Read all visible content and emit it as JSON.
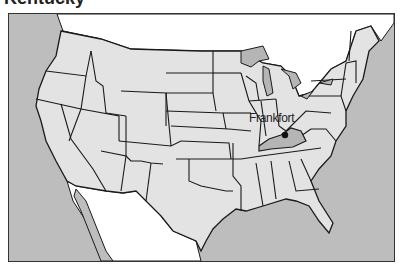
{
  "title": "Kentucky",
  "map": {
    "highlighted_state": "Kentucky",
    "capital_label": "Frankfort",
    "colors": {
      "ocean": "#bdbdbd",
      "states": "#e3e3e3",
      "highlight": "#b5b5b5",
      "lakes": "#b5b5b5",
      "foreign_land": "#ffffff",
      "border": "#1a1a1a"
    }
  }
}
